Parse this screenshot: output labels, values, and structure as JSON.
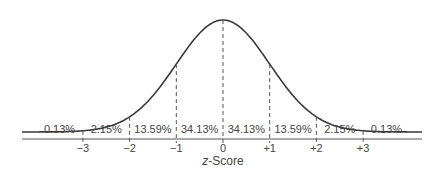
{
  "chart_data": {
    "type": "line",
    "title": "",
    "xlabel": "z-Score",
    "xlabel_italic_part": "z",
    "xlabel_rest": "-Score",
    "ylabel": "",
    "x_ticks": [
      "−3",
      "−2",
      "−1",
      "0",
      "+1",
      "+2",
      "+3"
    ],
    "x_tick_values": [
      -3,
      -2,
      -1,
      0,
      1,
      2,
      3
    ],
    "regions": [
      {
        "range": "< -3",
        "percent": "0.13%"
      },
      {
        "range": "-3 to -2",
        "percent": "2.15%"
      },
      {
        "range": "-2 to -1",
        "percent": "13.59%"
      },
      {
        "range": "-1 to 0",
        "percent": "34.13%"
      },
      {
        "range": "0 to +1",
        "percent": "34.13%"
      },
      {
        "range": "+1 to +2",
        "percent": "13.59%"
      },
      {
        "range": "+2 to +3",
        "percent": "2.15%"
      },
      {
        "range": "> +3",
        "percent": "0.13%"
      }
    ],
    "curve": "standard normal distribution (bell curve)",
    "grid": false,
    "legend": null
  }
}
